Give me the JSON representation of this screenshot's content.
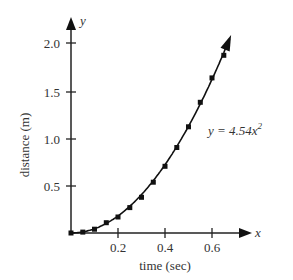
{
  "chart_data": {
    "type": "scatter",
    "title": "",
    "xlabel": "time (sec)",
    "ylabel": "distance (m)",
    "x_axis_symbol": "x",
    "y_axis_symbol": "y",
    "xlim": [
      0,
      0.7
    ],
    "ylim": [
      0,
      2.1
    ],
    "x_ticks": [
      0.2,
      0.4,
      0.6
    ],
    "x_tick_labels": [
      "0.2",
      "0.4",
      "0.6"
    ],
    "y_ticks": [
      0.5,
      1.0,
      1.5,
      2.0
    ],
    "y_tick_labels": [
      "0.5",
      "1.0",
      "1.5",
      "2.0"
    ],
    "grid": false,
    "series": [
      {
        "name": "measured",
        "marker": "square",
        "x": [
          0.0,
          0.05,
          0.1,
          0.15,
          0.2,
          0.25,
          0.3,
          0.35,
          0.4,
          0.45,
          0.5,
          0.55,
          0.6,
          0.65
        ],
        "y": [
          0.0,
          0.01,
          0.04,
          0.11,
          0.17,
          0.27,
          0.38,
          0.54,
          0.71,
          0.91,
          1.13,
          1.39,
          1.65,
          1.89
        ]
      },
      {
        "name": "fit",
        "type": "line",
        "equation": "y = 4.54x^2",
        "coefficient": 4.54
      }
    ],
    "annotations": [
      {
        "text": "y = 4.54x²",
        "x": 0.58,
        "y": 1.25
      }
    ]
  },
  "labels": {
    "xlabel": "time (sec)",
    "ylabel": "distance (m)",
    "x_sym": "x",
    "y_sym": "y",
    "eq_main": "y = 4.54x",
    "eq_sup": "2"
  },
  "ticks": {
    "x": [
      "0.2",
      "0.4",
      "0.6"
    ],
    "y": [
      "0.5",
      "1.0",
      "1.5",
      "2.0"
    ]
  }
}
